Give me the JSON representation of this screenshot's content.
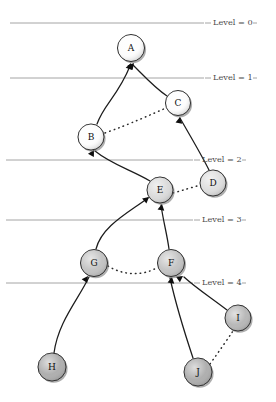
{
  "figure": {
    "kind": "tree-diagram",
    "background_color": "#ffffff",
    "width": 276,
    "height": 402
  },
  "levels": [
    {
      "label": "Level = 0",
      "y": 23,
      "line_x1": 10,
      "line_x2": 204,
      "label_x": 213
    },
    {
      "label": "Level = 1",
      "y": 78,
      "line_x1": 10,
      "line_x2": 204,
      "label_x": 213
    },
    {
      "label": "Level = 2",
      "y": 160,
      "line_x1": 6,
      "line_x2": 193,
      "label_x": 202
    },
    {
      "label": "Level = 3",
      "y": 220,
      "line_x1": 6,
      "line_x2": 193,
      "label_x": 202
    },
    {
      "label": "Level = 4",
      "y": 283,
      "line_x1": 6,
      "line_x2": 193,
      "label_x": 202
    }
  ],
  "nodes": [
    {
      "id": "A",
      "label": "A",
      "cx": 131,
      "cy": 48,
      "r": 13.5,
      "fill": "#fdfdfd"
    },
    {
      "id": "C",
      "label": "C",
      "cx": 178,
      "cy": 103,
      "r": 12.5,
      "fill": "#fdfdfd"
    },
    {
      "id": "B",
      "label": "B",
      "cx": 91,
      "cy": 137,
      "r": 13.0,
      "fill": "#fdfdfd"
    },
    {
      "id": "D",
      "label": "D",
      "cx": 213,
      "cy": 183,
      "r": 13.0,
      "fill": "#dcdcdc"
    },
    {
      "id": "E",
      "label": "E",
      "cx": 160,
      "cy": 190,
      "r": 13.0,
      "fill": "#d8d8d8"
    },
    {
      "id": "G",
      "label": "G",
      "cx": 94,
      "cy": 263,
      "r": 13.5,
      "fill": "#bfbfbf"
    },
    {
      "id": "F",
      "label": "F",
      "cx": 171,
      "cy": 263,
      "r": 13.5,
      "fill": "#bfbfbf"
    },
    {
      "id": "I",
      "label": "I",
      "cx": 238,
      "cy": 318,
      "r": 13.0,
      "fill": "#b2b2b2"
    },
    {
      "id": "H",
      "label": "H",
      "cx": 52,
      "cy": 367,
      "r": 14.0,
      "fill": "#a8a8a8"
    },
    {
      "id": "J",
      "label": "J",
      "cx": 198,
      "cy": 372,
      "r": 14.0,
      "fill": "#a8a8a8"
    }
  ],
  "edges_solid": [
    {
      "from": "B",
      "to": "A",
      "path": "M 97 124 C 104 104 118 96 130 66"
    },
    {
      "from": "C",
      "to": "A",
      "path": "M 167 96 C 155 88 146 78 133 65"
    },
    {
      "from": "E",
      "to": "B",
      "path": "M 150 181 C 131 170 111 164 95 151"
    },
    {
      "from": "D",
      "to": "C",
      "path": "M 209 170 C 200 152 189 134 180 118"
    },
    {
      "from": "G",
      "to": "E",
      "path": "M 96 249 C 102 226 128 213 148 198"
    },
    {
      "from": "F",
      "to": "E",
      "path": "M 169 249 C 167 234 163 220 161 205"
    },
    {
      "from": "H",
      "to": "G",
      "path": "M 54 353 C 58 322 78 300 89 277"
    },
    {
      "from": "J",
      "to": "F",
      "path": "M 193 358 C 185 334 176 305 170 278"
    },
    {
      "from": "I",
      "to": "F",
      "path": "M 227 310 C 210 297 196 288 184 277"
    }
  ],
  "edges_dotted": [
    {
      "from": "B",
      "to": "C",
      "path": "M 105 133 C 130 124 150 115 166 108"
    },
    {
      "from": "E",
      "to": "D",
      "path": "M 173 193 C 184 190 193 187 201 185"
    },
    {
      "from": "G",
      "to": "F",
      "path": "M 108 266 C 124 276 144 276 158 267"
    },
    {
      "from": "J",
      "to": "I",
      "path": "M 210 364 C 220 350 227 340 233 331"
    }
  ],
  "arrowheads": [
    {
      "at": "A",
      "x": 131,
      "y": 63,
      "angle": -70
    },
    {
      "at": "A2",
      "x": 134,
      "y": 63,
      "angle": -50
    },
    {
      "at": "C",
      "x": 180,
      "y": 117,
      "angle": -80
    },
    {
      "at": "B",
      "x": 94,
      "y": 150,
      "angle": -60
    },
    {
      "at": "E1",
      "x": 149,
      "y": 197,
      "angle": -40
    },
    {
      "at": "E2",
      "x": 162,
      "y": 204,
      "angle": -80
    },
    {
      "at": "G",
      "x": 88,
      "y": 276,
      "angle": -55
    },
    {
      "at": "F1",
      "x": 172,
      "y": 277,
      "angle": -80
    },
    {
      "at": "F2",
      "x": 183,
      "y": 276,
      "angle": -35
    }
  ]
}
